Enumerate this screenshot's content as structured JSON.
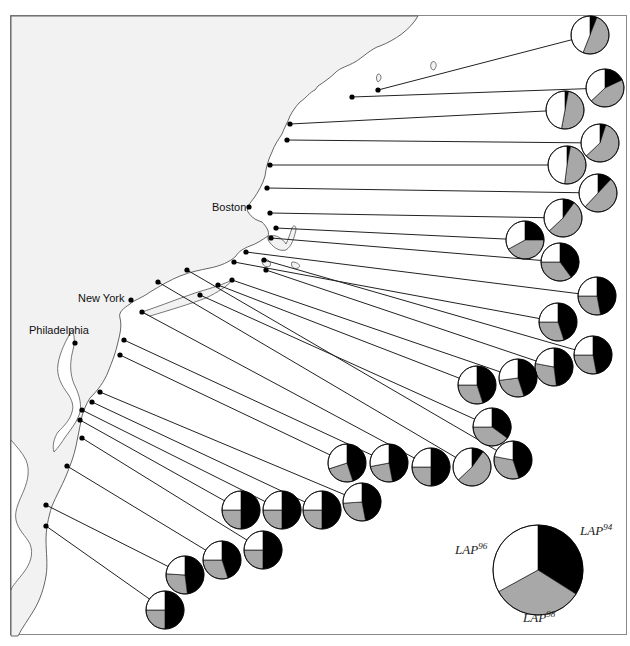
{
  "chart_data": {
    "type": "pie",
    "title": "",
    "legend": {
      "slices": [
        {
          "name": "LAP94",
          "base": "LAP",
          "sup": "94",
          "color": "#000000",
          "value": 0.34
        },
        {
          "name": "LAP98",
          "base": "LAP",
          "sup": "98",
          "color": "#a8a8a8",
          "value": 0.33
        },
        {
          "name": "LAP96",
          "base": "LAP",
          "sup": "96",
          "color": "#ffffff",
          "value": 0.33
        }
      ]
    },
    "cities": [
      {
        "name": "Boston"
      },
      {
        "name": "New York"
      },
      {
        "name": "Philadelphia"
      }
    ],
    "sites": [
      {
        "id": 1,
        "LAP94": 0.06,
        "LAP98": 0.5,
        "LAP96": 0.44
      },
      {
        "id": 2,
        "LAP94": 0.18,
        "LAP98": 0.45,
        "LAP96": 0.37
      },
      {
        "id": 3,
        "LAP94": 0.03,
        "LAP98": 0.5,
        "LAP96": 0.47
      },
      {
        "id": 4,
        "LAP94": 0.05,
        "LAP98": 0.58,
        "LAP96": 0.37
      },
      {
        "id": 5,
        "LAP94": 0.03,
        "LAP98": 0.49,
        "LAP96": 0.48
      },
      {
        "id": 6,
        "LAP94": 0.12,
        "LAP98": 0.5,
        "LAP96": 0.38
      },
      {
        "id": 7,
        "LAP94": 0.1,
        "LAP98": 0.53,
        "LAP96": 0.37
      },
      {
        "id": 8,
        "LAP94": 0.25,
        "LAP98": 0.42,
        "LAP96": 0.33
      },
      {
        "id": 9,
        "LAP94": 0.4,
        "LAP98": 0.35,
        "LAP96": 0.25
      },
      {
        "id": 10,
        "LAP94": 0.47,
        "LAP98": 0.28,
        "LAP96": 0.25
      },
      {
        "id": 11,
        "LAP94": 0.45,
        "LAP98": 0.3,
        "LAP96": 0.25
      },
      {
        "id": 12,
        "LAP94": 0.47,
        "LAP98": 0.28,
        "LAP96": 0.25
      },
      {
        "id": 13,
        "LAP94": 0.48,
        "LAP98": 0.3,
        "LAP96": 0.22
      },
      {
        "id": 14,
        "LAP94": 0.45,
        "LAP98": 0.28,
        "LAP96": 0.27
      },
      {
        "id": 15,
        "LAP94": 0.45,
        "LAP98": 0.3,
        "LAP96": 0.25
      },
      {
        "id": 16,
        "LAP94": 0.35,
        "LAP98": 0.4,
        "LAP96": 0.25
      },
      {
        "id": 17,
        "LAP94": 0.45,
        "LAP98": 0.33,
        "LAP96": 0.22
      },
      {
        "id": 18,
        "LAP94": 0.1,
        "LAP98": 0.53,
        "LAP96": 0.37
      },
      {
        "id": 19,
        "LAP94": 0.5,
        "LAP98": 0.25,
        "LAP96": 0.25
      },
      {
        "id": 20,
        "LAP94": 0.47,
        "LAP98": 0.25,
        "LAP96": 0.28
      },
      {
        "id": 21,
        "LAP94": 0.45,
        "LAP98": 0.25,
        "LAP96": 0.3
      },
      {
        "id": 22,
        "LAP94": 0.47,
        "LAP98": 0.27,
        "LAP96": 0.26
      },
      {
        "id": 23,
        "LAP94": 0.5,
        "LAP98": 0.25,
        "LAP96": 0.25
      },
      {
        "id": 24,
        "LAP94": 0.5,
        "LAP98": 0.25,
        "LAP96": 0.25
      },
      {
        "id": 25,
        "LAP94": 0.5,
        "LAP98": 0.25,
        "LAP96": 0.25
      },
      {
        "id": 26,
        "LAP94": 0.5,
        "LAP98": 0.25,
        "LAP96": 0.25
      },
      {
        "id": 27,
        "LAP94": 0.45,
        "LAP98": 0.3,
        "LAP96": 0.25
      },
      {
        "id": 28,
        "LAP94": 0.48,
        "LAP98": 0.28,
        "LAP96": 0.24
      },
      {
        "id": 29,
        "LAP94": 0.5,
        "LAP98": 0.25,
        "LAP96": 0.25
      }
    ]
  }
}
